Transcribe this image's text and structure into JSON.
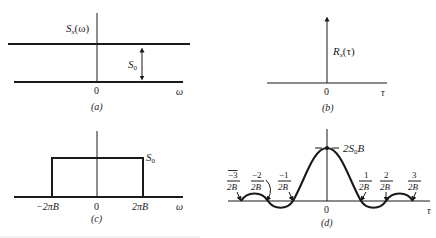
{
  "figure": {
    "panels": {
      "a": {
        "caption": "(a)",
        "y_label": "S",
        "y_label_sub": "x",
        "y_label_arg": "(ω)",
        "x_axis_label": "ω",
        "origin_label": "0",
        "level_label": "S",
        "level_label_sub": "0"
      },
      "b": {
        "caption": "(b)",
        "y_label": "R",
        "y_label_sub": "x",
        "y_label_arg": "(τ)",
        "x_axis_label": "τ",
        "origin_label": "0"
      },
      "c": {
        "caption": "(c)",
        "level_label": "S",
        "level_label_sub": "0",
        "x_axis_label": "ω",
        "ticks": [
          "−2πB",
          "0",
          "2πB"
        ]
      },
      "d": {
        "caption": "(d)",
        "peak_label": "2S",
        "peak_label_sub": "0",
        "peak_label_tail": "B",
        "x_axis_label": "τ",
        "origin_label": "0",
        "zeros": [
          {
            "num": "−3",
            "den": "2B"
          },
          {
            "num": "−2",
            "den": "2B"
          },
          {
            "num": "−1",
            "den": "2B"
          },
          {
            "num": "1",
            "den": "2B"
          },
          {
            "num": "2",
            "den": "2B"
          },
          {
            "num": "3",
            "den": "2B"
          }
        ]
      }
    }
  }
}
